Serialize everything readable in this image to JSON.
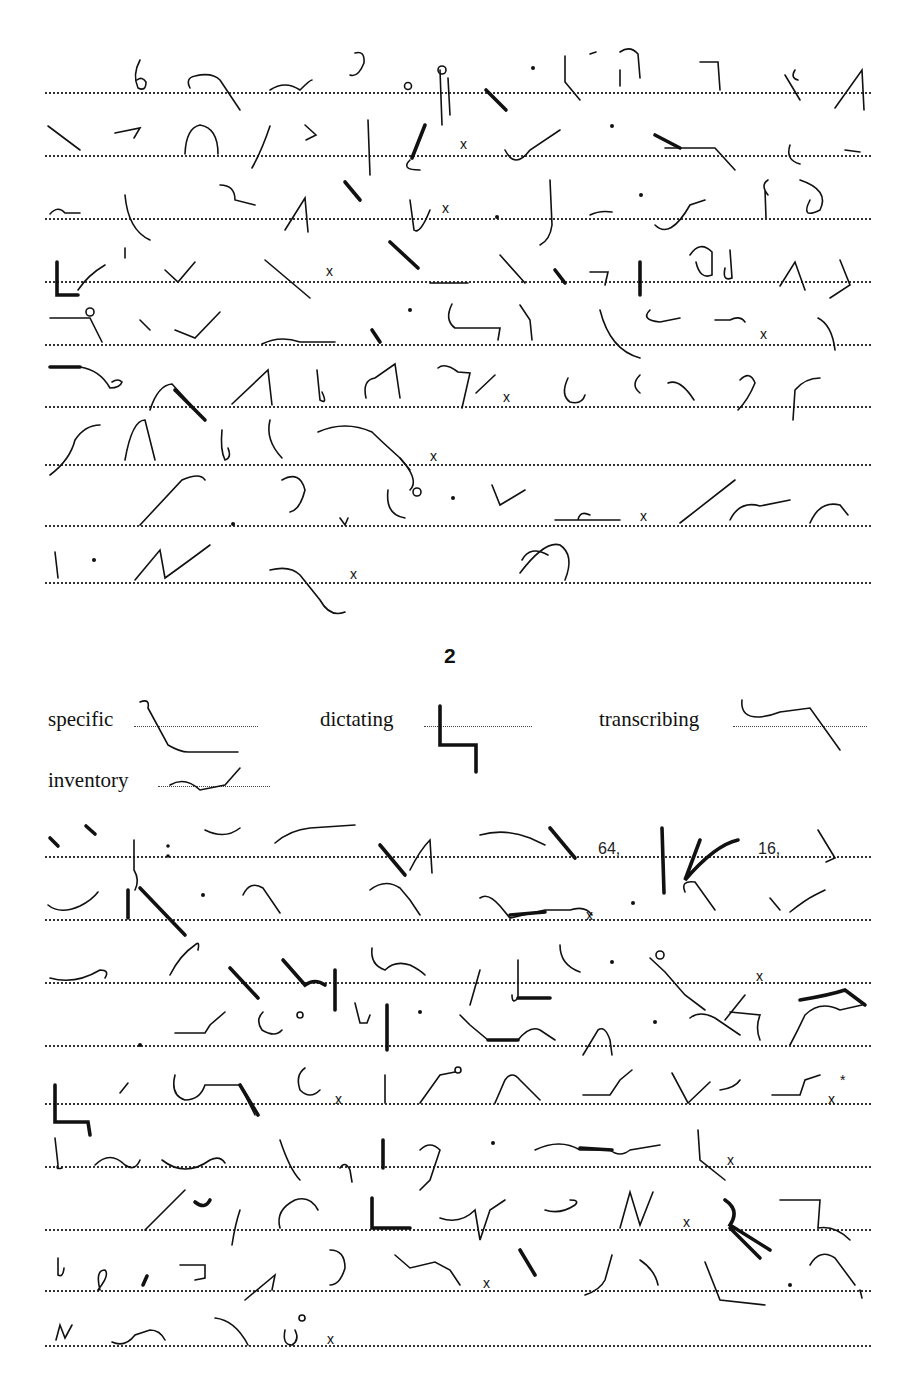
{
  "page": {
    "type": "shorthand-exercise",
    "section_number": "2",
    "key_words": [
      {
        "word": "specific"
      },
      {
        "word": "dictating"
      },
      {
        "word": "transcribing"
      },
      {
        "word": "inventory"
      }
    ],
    "inline_numerals": [
      "64,",
      "16,"
    ],
    "punctuation_marks": {
      "period": "x",
      "dash": "*"
    },
    "passage_1": {
      "line_count": 9
    },
    "passage_2": {
      "line_count": 9
    }
  }
}
